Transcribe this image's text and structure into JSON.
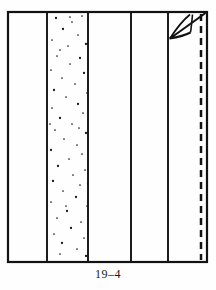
{
  "figure": {
    "caption": "19–4",
    "background_color": "#fefefe",
    "line_color": "#121212",
    "stipple_color": "#1a1a1a"
  },
  "chart_data": {
    "type": "diagram",
    "title": "19–4",
    "frame": {
      "x": 8,
      "y": 12,
      "width": 199,
      "height": 250,
      "stroke_width": 2.2
    },
    "vertical_dividers": [
      {
        "name": "divider-1",
        "x": 47,
        "stroke_width": 1.8,
        "style": "solid"
      },
      {
        "name": "divider-2",
        "x": 88,
        "stroke_width": 1.8,
        "style": "solid"
      },
      {
        "name": "divider-3",
        "x": 131,
        "stroke_width": 1.8,
        "style": "solid"
      },
      {
        "name": "divider-4",
        "x": 168,
        "stroke_width": 1.8,
        "style": "solid"
      }
    ],
    "dashed_line": {
      "name": "stitch-line",
      "x": 201,
      "y_start": 14,
      "y_end": 260,
      "style": "dashed",
      "dash_pattern": "7 5",
      "stroke_width": 2.4
    },
    "panels": [
      {
        "index": 1,
        "x_start": 8,
        "x_end": 47,
        "fill": "plain"
      },
      {
        "index": 2,
        "x_start": 48,
        "x_end": 88,
        "fill": "stipple"
      },
      {
        "index": 3,
        "x_start": 88,
        "x_end": 131,
        "fill": "plain"
      },
      {
        "index": 4,
        "x_start": 131,
        "x_end": 168,
        "fill": "plain"
      },
      {
        "index": 5,
        "x_start": 168,
        "x_end": 207,
        "fill": "plain"
      }
    ],
    "corner_detail": {
      "name": "folded-corner-dart",
      "location": "top-right",
      "diagonal_line": {
        "x1": 170,
        "y1": 38,
        "x2": 205,
        "y2": 13
      },
      "arc": {
        "from_x": 170,
        "from_y": 38,
        "to_x": 189,
        "to_y": 14,
        "curve": "concave"
      },
      "lower_arc": {
        "from_x": 170,
        "from_y": 38,
        "to_x": 191,
        "to_y": 33
      },
      "stipple": true
    },
    "stipple_dots": [
      [
        56,
        18
      ],
      [
        72,
        22
      ],
      [
        82,
        16
      ],
      [
        63,
        29
      ],
      [
        78,
        35
      ],
      [
        52,
        40
      ],
      [
        86,
        44
      ],
      [
        68,
        46
      ],
      [
        57,
        56
      ],
      [
        80,
        58
      ],
      [
        70,
        64
      ],
      [
        51,
        70
      ],
      [
        84,
        73
      ],
      [
        62,
        78
      ],
      [
        75,
        84
      ],
      [
        54,
        90
      ],
      [
        87,
        93
      ],
      [
        66,
        97
      ],
      [
        78,
        104
      ],
      [
        52,
        108
      ],
      [
        83,
        113
      ],
      [
        60,
        118
      ],
      [
        72,
        124
      ],
      [
        55,
        130
      ],
      [
        86,
        133
      ],
      [
        64,
        139
      ],
      [
        77,
        145
      ],
      [
        51,
        150
      ],
      [
        82,
        154
      ],
      [
        69,
        159
      ],
      [
        58,
        166
      ],
      [
        85,
        170
      ],
      [
        73,
        175
      ],
      [
        53,
        181
      ],
      [
        80,
        185
      ],
      [
        63,
        191
      ],
      [
        76,
        197
      ],
      [
        51,
        202
      ],
      [
        87,
        206
      ],
      [
        67,
        211
      ],
      [
        57,
        218
      ],
      [
        81,
        222
      ],
      [
        71,
        228
      ],
      [
        54,
        234
      ],
      [
        84,
        238
      ],
      [
        62,
        243
      ],
      [
        77,
        249
      ],
      [
        60,
        254
      ],
      [
        86,
        256
      ],
      [
        70,
        17
      ],
      [
        60,
        50
      ],
      [
        90,
        67
      ],
      [
        79,
        128
      ],
      [
        66,
        206
      ],
      [
        88,
        184
      ],
      [
        50,
        124
      ]
    ]
  }
}
